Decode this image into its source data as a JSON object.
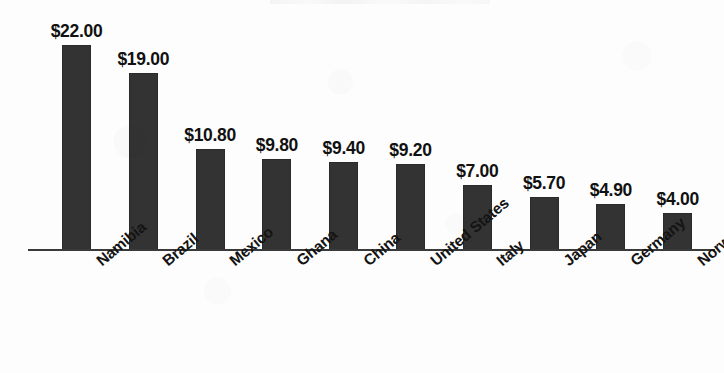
{
  "chart_data": {
    "type": "bar",
    "title": "",
    "xlabel": "",
    "ylabel": "",
    "ylim": [
      0,
      22
    ],
    "grid": false,
    "legend": "none",
    "orientation": "vertical",
    "value_prefix": "$",
    "categories": [
      "Namibia",
      "Brazil",
      "Mexico",
      "Ghana",
      "China",
      "United States",
      "Italy",
      "Japan",
      "Germany",
      "Norway"
    ],
    "values": [
      22.0,
      19.0,
      10.8,
      9.8,
      9.4,
      9.2,
      7.0,
      5.7,
      4.9,
      4.0
    ],
    "value_labels": [
      "$22.00",
      "$19.00",
      "$10.80",
      "$9.80",
      "$9.40",
      "$9.20",
      "$7.00",
      "$5.70",
      "$4.90",
      "$4.00"
    ],
    "bar_color": "#333333",
    "axis_color": "#3a3a3a",
    "background_color": "#fdfdfd"
  }
}
